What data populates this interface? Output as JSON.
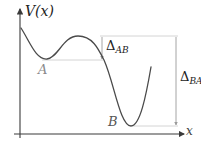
{
  "diagram": {
    "axes": {
      "y_label": "V(x)",
      "x_label": "x"
    },
    "points": {
      "a_label": "A",
      "b_label": "B"
    },
    "barriers": {
      "ab": {
        "symbol": "Δ",
        "subscript": "AB"
      },
      "ba": {
        "symbol": "Δ",
        "subscript": "BA"
      }
    },
    "colors": {
      "curve": "#4a4a4a",
      "axes": "#3a3a3a",
      "guide_lines": "#c8c8c8",
      "arrows": "#9a9a9a",
      "label_a": "#8a8a8a",
      "label_b": "#555555"
    }
  }
}
